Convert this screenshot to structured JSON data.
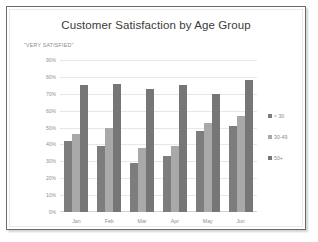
{
  "chart_data": {
    "type": "bar",
    "title": "Customer Satisfaction by Age Group",
    "subtitle": "\"VERY SATISFIED\"",
    "xlabel": "",
    "ylabel": "",
    "ylim": [
      0,
      90
    ],
    "ytick_labels": [
      "90%",
      "80%",
      "70%",
      "60%",
      "50%",
      "40%",
      "30%",
      "20%",
      "10%",
      "0%"
    ],
    "ytick_values": [
      90,
      80,
      70,
      60,
      50,
      40,
      30,
      20,
      10,
      0
    ],
    "grid": true,
    "legend_position": "right",
    "categories": [
      "Jan",
      "Feb",
      "Mar",
      "Apr",
      "May",
      "Jun"
    ],
    "series": [
      {
        "name": "< 30",
        "color": "#7d7d7d",
        "values": [
          42,
          39,
          29,
          33,
          48,
          51
        ]
      },
      {
        "name": "30-49",
        "color": "#a9a9a9",
        "values": [
          46,
          50,
          38,
          39,
          53,
          57
        ]
      },
      {
        "name": "50+",
        "color": "#767676",
        "values": [
          75,
          76,
          73,
          75,
          70,
          78
        ]
      }
    ]
  },
  "colors": {
    "frame_border": "#6a6a6a",
    "grid": "#e4e8ec",
    "axis": "#d0d4d8",
    "title_text": "#3a3a3a",
    "tick_text": "#8f8f8f",
    "background": "#ffffff"
  }
}
